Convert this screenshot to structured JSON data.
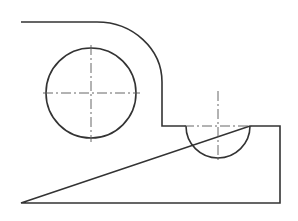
{
  "drawing": {
    "type": "technical-drawing",
    "description": "Plate outline with rounded top-right corner, step notch, full circular hole and semicircular cutout with centerlines",
    "features": [
      {
        "name": "plate-outline",
        "kind": "profile"
      },
      {
        "name": "circular-hole",
        "kind": "circle",
        "centerlines": true
      },
      {
        "name": "semicircular-cutout",
        "kind": "semicircle",
        "centerlines": true
      }
    ],
    "colors": {
      "line": "#333333",
      "centerline": "#555555",
      "background": "#ffffff"
    }
  }
}
